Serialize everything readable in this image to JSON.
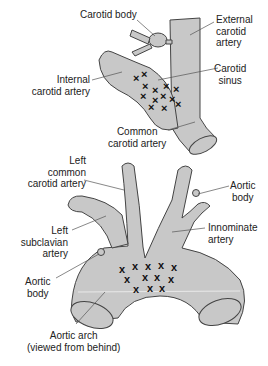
{
  "figure": {
    "colors": {
      "vessel_fill": "#c8c8c8",
      "outline": "#444444",
      "marker": "#111111",
      "leader": "#555555"
    },
    "top_panel": {
      "title": "Carotid sinus and body",
      "labels": {
        "carotid_body": "Carotid body",
        "external_carotid_1": "External",
        "external_carotid_2": "carotid",
        "external_carotid_3": "artery",
        "internal_carotid_1": "Internal",
        "internal_carotid_2": "carotid artery",
        "carotid_sinus_1": "Carotid",
        "carotid_sinus_2": "sinus",
        "common_carotid_1": "Common",
        "common_carotid_2": "carotid artery"
      },
      "marker_glyph": "x",
      "marker_count": 13
    },
    "bottom_panel": {
      "title": "Aortic arch and bodies",
      "labels": {
        "left_common_carotid_1": "Left",
        "left_common_carotid_2": "common",
        "left_common_carotid_3": "carotid artery",
        "aortic_body_right_1": "Aortic",
        "aortic_body_right_2": "body",
        "left_subclavian_1": "Left",
        "left_subclavian_2": "subclavian",
        "left_subclavian_3": "artery",
        "innominate_1": "Innominate",
        "innominate_2": "artery",
        "aortic_body_left_1": "Aortic",
        "aortic_body_left_2": "body",
        "aortic_arch_1": "Aortic arch",
        "aortic_arch_2": "(viewed from behind)"
      },
      "marker_glyph": "x",
      "marker_count": 12
    }
  }
}
